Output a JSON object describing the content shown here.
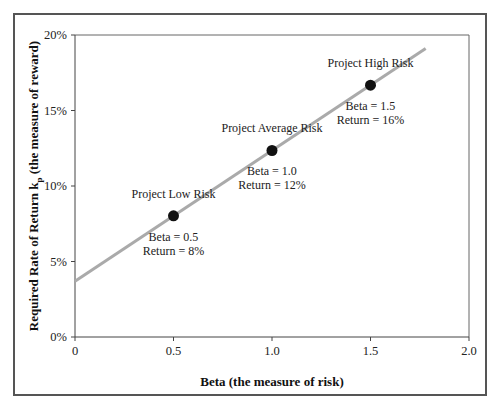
{
  "chart_data": {
    "type": "line",
    "title": "",
    "xlabel": "Beta (the measure of risk)",
    "ylabel": "Required Rate of Return k",
    "ylabel_subscript": "p",
    "ylabel_suffix": " (the measure of reward)",
    "xlim": [
      0,
      2.0
    ],
    "ylim": [
      0,
      20
    ],
    "x_ticks": [
      "0",
      "0.5",
      "1.0",
      "1.5",
      "2.0"
    ],
    "y_ticks": [
      "0%",
      "5%",
      "10%",
      "15%",
      "20%"
    ],
    "grid": false,
    "legend": null,
    "series": [
      {
        "name": "Security Market Line",
        "x": [
          0,
          1.78
        ],
        "y": [
          3.7,
          19.1
        ],
        "color": "#aaaaaa"
      }
    ],
    "points": [
      {
        "name": "Project Low Risk",
        "beta": 0.5,
        "return": 8,
        "label_beta": "Beta = 0.5",
        "label_return": "Return = 8%"
      },
      {
        "name": "Project Average Risk",
        "beta": 1.0,
        "return": 12,
        "label_beta": "Beta = 1.0",
        "label_return": "Return = 12%"
      },
      {
        "name": "Project High Risk",
        "beta": 1.5,
        "return": 16,
        "label_beta": "Beta = 1.5",
        "label_return": "Return = 16%"
      }
    ]
  }
}
